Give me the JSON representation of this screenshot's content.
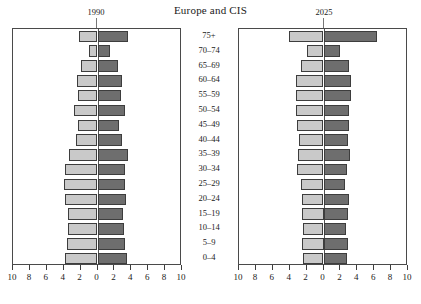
{
  "header": {
    "title": "Europe and CIS",
    "left_year": "1990",
    "right_year": "2025"
  },
  "axis": {
    "tick_labels": [
      "10",
      "8",
      "6",
      "4",
      "2",
      "0",
      "2",
      "4",
      "6",
      "8",
      "10"
    ],
    "tick_values": [
      -10,
      -8,
      -6,
      -4,
      -2,
      0,
      2,
      4,
      6,
      8,
      10
    ],
    "min": -10,
    "max": 10
  },
  "age_groups": [
    "75+",
    "70–74",
    "65–69",
    "60–64",
    "55–59",
    "50–54",
    "45–49",
    "40–44",
    "35–39",
    "30–34",
    "25–29",
    "20–24",
    "15–19",
    "10–14",
    "5–9",
    "0–4"
  ],
  "colors": {
    "left_bar": "#c9c9c9",
    "right_bar": "#6e6e6e",
    "frame": "#4a4a4a",
    "zero_line": "#555555",
    "text": "#1a1a1a",
    "background": "#ffffff"
  },
  "chart_data": {
    "type": "bar",
    "title": "Europe and CIS",
    "xlabel": "",
    "ylabel": "",
    "xlim": [
      -10,
      10
    ],
    "grid": false,
    "legend": "none",
    "orientation": "horizontal-population-pyramid",
    "categories": [
      "75+",
      "70–74",
      "65–69",
      "60–64",
      "55–59",
      "50–54",
      "45–49",
      "40–44",
      "35–39",
      "30–34",
      "25–29",
      "20–24",
      "15–19",
      "10–14",
      "5–9",
      "0–4"
    ],
    "panels": [
      {
        "name": "1990",
        "series": [
          {
            "name": "left-side-1990",
            "side": "left",
            "values": [
              2.2,
              1.0,
              2.0,
              2.4,
              2.3,
              2.8,
              2.3,
              2.6,
              3.4,
              3.9,
              4.0,
              3.8,
              3.5,
              3.5,
              3.6,
              3.8
            ]
          },
          {
            "name": "right-side-1990",
            "side": "right",
            "values": [
              3.6,
              1.5,
              2.4,
              2.9,
              2.8,
              3.3,
              2.6,
              2.9,
              3.6,
              3.3,
              3.3,
              3.4,
              3.0,
              3.1,
              3.2,
              3.5
            ]
          }
        ]
      },
      {
        "name": "2025",
        "series": [
          {
            "name": "left-side-2025",
            "side": "left",
            "values": [
              4.1,
              2.0,
              2.7,
              3.2,
              3.2,
              3.3,
              3.1,
              2.9,
              3.0,
              3.1,
              2.7,
              2.6,
              2.5,
              2.4,
              2.5,
              2.4
            ]
          },
          {
            "name": "right-side-2025",
            "side": "right",
            "values": [
              6.3,
              2.0,
              3.0,
              3.2,
              3.2,
              3.0,
              3.0,
              2.9,
              3.1,
              2.8,
              2.6,
              3.0,
              2.9,
              2.7,
              2.9,
              2.8
            ]
          }
        ]
      }
    ]
  }
}
